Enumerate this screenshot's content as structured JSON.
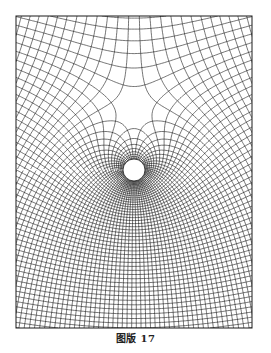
{
  "figure": {
    "caption": "图版 17",
    "line_color": "#1a1a1a",
    "background_color": "#ffffff",
    "obstacle_fill": "#ffffff"
  }
}
